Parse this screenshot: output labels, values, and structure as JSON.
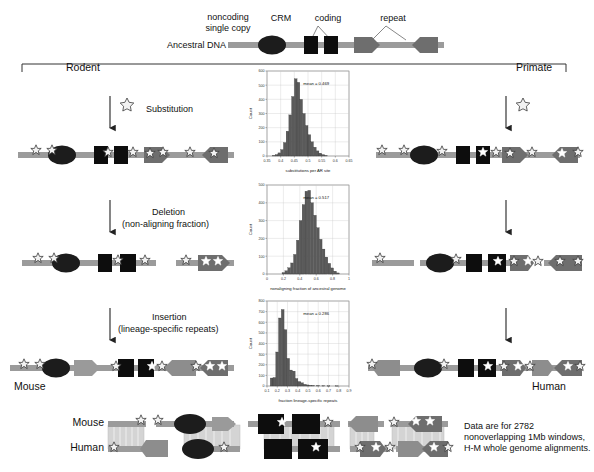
{
  "figure": {
    "top": {
      "legend_noncoding": "noncoding\nsingle copy",
      "legend_crm": "CRM",
      "legend_coding": "coding",
      "legend_repeat": "repeat",
      "ancestral_label": "Ancestral DNA"
    },
    "branches": {
      "left": "Rodent",
      "right": "Primate"
    },
    "steps": [
      {
        "label": "Substitution",
        "sub": ""
      },
      {
        "label": "Deletion",
        "sub": "(non-aligning fraction)"
      },
      {
        "label": "Insertion",
        "sub": "(lineage-specific repeats)"
      }
    ],
    "species": {
      "left": "Mouse",
      "right": "Human"
    },
    "alignment": {
      "row1": "Mouse",
      "row2": "Human"
    },
    "caption": "Data are for 2782\nnonoverlapping 1Mb windows,\nH-M whole genome alignments.",
    "colors": {
      "backbone": "#9b9b9b",
      "crm": "#1c1c1c",
      "coding": "#0d0d0d",
      "repeat": "#6e6e6e",
      "bar": "#5a5a5a",
      "grid": "#c8c8c8",
      "star_fill": "#f2f2f2",
      "star_stroke": "#3a3a3a"
    }
  },
  "chart_data": [
    {
      "type": "bar",
      "title": "",
      "xlabel": "substitutions per AR site",
      "ylabel": "Count",
      "annotation": "mean = 0.469",
      "xlim": [
        0.35,
        0.65
      ],
      "ylim": [
        0,
        600
      ],
      "xticks": [
        "0.35",
        "0.4",
        "0.45",
        "0.5",
        "0.55",
        "0.6",
        "0.65"
      ],
      "yticks": [
        "0",
        "100",
        "200",
        "300",
        "400",
        "500",
        "600"
      ],
      "grid": true,
      "bin_width": 0.01,
      "categories": [
        0.375,
        0.385,
        0.395,
        0.405,
        0.415,
        0.425,
        0.435,
        0.445,
        0.455,
        0.465,
        0.475,
        0.485,
        0.495,
        0.505,
        0.515,
        0.525,
        0.535,
        0.545,
        0.555,
        0.565
      ],
      "values": [
        4,
        10,
        22,
        45,
        95,
        175,
        290,
        420,
        545,
        520,
        400,
        300,
        215,
        150,
        100,
        62,
        36,
        20,
        10,
        4
      ]
    },
    {
      "type": "bar",
      "title": "",
      "xlabel": "nonaligning fraction of ancestral genome",
      "ylabel": "Count",
      "annotation": "mean = 0.517",
      "xlim": [
        0,
        1
      ],
      "ylim": [
        0,
        500
      ],
      "xticks": [
        "0",
        "0.2",
        "0.4",
        "0.6",
        "0.8",
        "1"
      ],
      "yticks": [
        "0",
        "100",
        "200",
        "300",
        "400",
        "500"
      ],
      "grid": true,
      "bin_width": 0.033,
      "categories": [
        0.2,
        0.235,
        0.27,
        0.305,
        0.34,
        0.375,
        0.41,
        0.445,
        0.48,
        0.515,
        0.55,
        0.585,
        0.62,
        0.655,
        0.69,
        0.725,
        0.76,
        0.795,
        0.83,
        0.865
      ],
      "values": [
        8,
        18,
        35,
        62,
        110,
        190,
        300,
        390,
        465,
        470,
        400,
        330,
        260,
        195,
        140,
        95,
        60,
        34,
        16,
        6
      ]
    },
    {
      "type": "bar",
      "title": "",
      "xlabel": "fraction lineage-specific repeats",
      "ylabel": "Count",
      "annotation": "mean = 0.286",
      "xlim": [
        0.1,
        0.9
      ],
      "ylim": [
        0,
        800
      ],
      "xticks": [
        "0.1",
        "0.2",
        "0.3",
        "0.4",
        "0.5",
        "0.6",
        "0.7",
        "0.8",
        "0.9"
      ],
      "yticks": [
        "0",
        "100",
        "200",
        "300",
        "400",
        "500",
        "600",
        "700",
        "800"
      ],
      "grid": true,
      "bin_width": 0.027,
      "categories": [
        0.145,
        0.172,
        0.199,
        0.226,
        0.253,
        0.28,
        0.307,
        0.334,
        0.361,
        0.388,
        0.415,
        0.442,
        0.469,
        0.496,
        0.523,
        0.55,
        0.6,
        0.65,
        0.7,
        0.78
      ],
      "values": [
        75,
        80,
        320,
        640,
        720,
        530,
        260,
        150,
        140,
        70,
        42,
        30,
        16,
        10,
        6,
        5,
        4,
        3,
        2,
        2
      ]
    }
  ]
}
